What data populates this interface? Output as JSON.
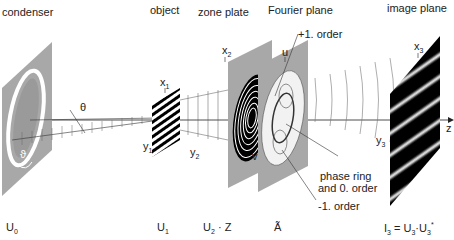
{
  "planes": [
    {
      "id": "condenser",
      "title": "condenser",
      "field": "U0",
      "field_main": "U",
      "field_sub": "0",
      "field_sup": ""
    },
    {
      "id": "object",
      "title": "object",
      "field": "U1",
      "field_main": "U",
      "field_sub": "1",
      "field_sup": ""
    },
    {
      "id": "zone-plate",
      "title": "zone plate",
      "field": "U2 · Z",
      "field_main": "U",
      "field_sub": "2",
      "field_tail": " · Z"
    },
    {
      "id": "fourier-plane",
      "title": "Fourier plane",
      "field": "Ã",
      "field_main": "Ã"
    },
    {
      "id": "image-plane",
      "title": "image plane",
      "field": "I3 = U3·U3*",
      "field_main": "I",
      "field_sub": "3",
      "field_mid": " = U",
      "field_sub2": "3",
      "field_mid2": "·U",
      "field_sub3": "3",
      "field_sup3": "*"
    }
  ],
  "axes": {
    "x1": "x",
    "x1_sub": "1",
    "y1": "y",
    "y1_sub": "1",
    "x2": "x",
    "x2_sub": "2",
    "y2": "y",
    "y2_sub": "2",
    "u": "u",
    "v": "v",
    "x3": "x",
    "x3_sub": "3",
    "y3": "y",
    "y3_sub": "3",
    "z": "z"
  },
  "annotations": {
    "theta": "θ",
    "phi": "ϑ",
    "plus_first_order": "+1. order",
    "phase_ring_line1": "phase ring",
    "phase_ring_line2": "and 0. order",
    "minus_first_order": "-1. order"
  },
  "colors": {
    "plane_fill": "#a8a8a8",
    "dark": "#111111",
    "line": "#333333"
  }
}
